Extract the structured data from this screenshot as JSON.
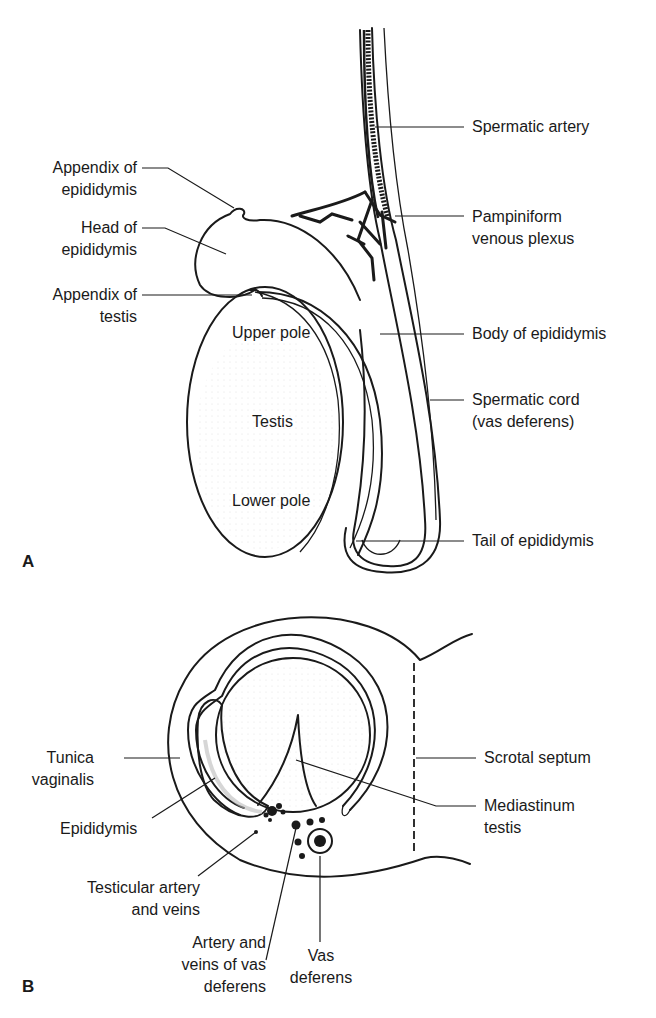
{
  "panels": {
    "a": {
      "letter": "A",
      "labels": {
        "spermatic_artery": "Spermatic artery",
        "appendix_epididymis": [
          "Appendix of",
          "epididymis"
        ],
        "pampiniform": [
          "Pampiniform",
          "venous plexus"
        ],
        "head_epididymis": [
          "Head of",
          "epididymis"
        ],
        "appendix_testis": [
          "Appendix of",
          "testis"
        ],
        "upper_pole": "Upper pole",
        "body_epididymis": "Body of epididymis",
        "testis": "Testis",
        "spermatic_cord": [
          "Spermatic cord",
          "(vas deferens)"
        ],
        "lower_pole": "Lower pole",
        "tail_epididymis": "Tail of epididymis"
      }
    },
    "b": {
      "letter": "B",
      "labels": {
        "tunica_vaginalis": [
          "Tunica",
          "vaginalis"
        ],
        "scrotal_septum": "Scrotal septum",
        "mediastinum_testis": [
          "Mediastinum",
          "testis"
        ],
        "epididymis": "Epididymis",
        "testicular_artery": [
          "Testicular artery",
          "and veins"
        ],
        "artery_veins_vas": [
          "Artery and",
          "veins of vas",
          "deferens"
        ],
        "vas_deferens": [
          "Vas",
          "deferens"
        ]
      }
    }
  },
  "colors": {
    "ink": "#1a1a1a",
    "background": "#ffffff",
    "stipple": "#c8c8c8"
  }
}
